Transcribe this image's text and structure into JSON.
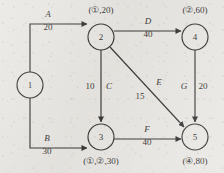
{
  "diagram": {
    "type": "directed-network-graph",
    "title": "",
    "background_color": "#e8e6e2",
    "line_color": "#1b1b1b",
    "nodes": [
      {
        "id": "1",
        "label": "1",
        "annotation": "",
        "cx": 30,
        "cy": 85
      },
      {
        "id": "2",
        "label": "2",
        "annotation": "(①,20)",
        "cx": 101,
        "cy": 37
      },
      {
        "id": "3",
        "label": "3",
        "annotation": "(①,②,30)",
        "cx": 101,
        "cy": 137
      },
      {
        "id": "4",
        "label": "4",
        "annotation": "(②,60)",
        "cx": 195,
        "cy": 37
      },
      {
        "id": "5",
        "label": "5",
        "annotation": "(④,80)",
        "cx": 195,
        "cy": 137
      }
    ],
    "edges": [
      {
        "id": "A",
        "name": "A",
        "weight": "20",
        "from": "1",
        "to": "2"
      },
      {
        "id": "B",
        "name": "B",
        "weight": "30",
        "from": "1",
        "to": "3"
      },
      {
        "id": "C",
        "name": "C",
        "weight": "10",
        "from": "2",
        "to": "3"
      },
      {
        "id": "D",
        "name": "D",
        "weight": "40",
        "from": "2",
        "to": "4"
      },
      {
        "id": "E",
        "name": "E",
        "weight": "15",
        "from": "2",
        "to": "5"
      },
      {
        "id": "F",
        "name": "F",
        "weight": "40",
        "from": "3",
        "to": "5"
      },
      {
        "id": "G",
        "name": "G",
        "weight": "20",
        "from": "4",
        "to": "5"
      }
    ]
  }
}
